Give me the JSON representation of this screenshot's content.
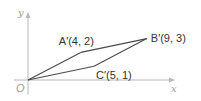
{
  "figure": {
    "type": "coordinate-diagram",
    "axes": {
      "x_label": "x",
      "y_label": "y",
      "origin_label": "O",
      "x_range": [
        0,
        11
      ],
      "y_range": [
        0,
        5
      ]
    },
    "points": [
      {
        "id": "O",
        "x": 0,
        "y": 0,
        "label": ""
      },
      {
        "id": "A'",
        "x": 4,
        "y": 2,
        "label": "A′(4, 2)"
      },
      {
        "id": "B'",
        "x": 9,
        "y": 3,
        "label": "B′(9, 3)"
      },
      {
        "id": "C'",
        "x": 5,
        "y": 1,
        "label": "C′(5, 1)"
      }
    ],
    "polygon": [
      "O",
      "A'",
      "B'",
      "C'"
    ],
    "colors": {
      "axis": "#b8b8b8",
      "edge": "#4a4a4a",
      "text": "#333333",
      "axis_text": "#9a9a9a"
    }
  }
}
